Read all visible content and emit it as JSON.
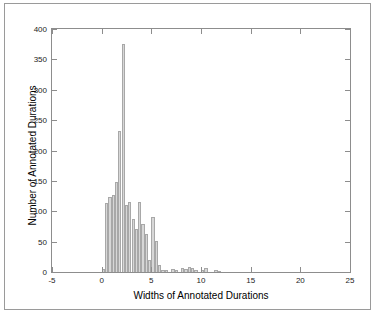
{
  "chart_data": {
    "type": "bar",
    "title": "",
    "subtitle": "",
    "xlabel": "Widths of Annotated Durations",
    "ylabel": "Number of Annotated Durations",
    "xlim": [
      -5,
      25
    ],
    "ylim": [
      0,
      400
    ],
    "xticks": [
      -5,
      0,
      5,
      10,
      15,
      20,
      25
    ],
    "xticklabels": [
      "-5",
      "0",
      "5",
      "10",
      "15",
      "20",
      "25"
    ],
    "yticks": [
      0,
      50,
      100,
      150,
      200,
      250,
      300,
      350,
      400
    ],
    "yticklabels": [
      "0",
      "50",
      "100",
      "150",
      "200",
      "250",
      "300",
      "350",
      "400"
    ],
    "grid": false,
    "legend": null,
    "bin_width": 0.333,
    "bar_fill_color": "#d7d7d7",
    "bar_edge_color": "#a8a8a8",
    "axis_color": "#8d8d8d",
    "frame_color": "#9a9a9a",
    "bins": [
      {
        "x": 0.17,
        "value": 5
      },
      {
        "x": 0.5,
        "value": 113
      },
      {
        "x": 0.83,
        "value": 124
      },
      {
        "x": 1.17,
        "value": 127
      },
      {
        "x": 1.5,
        "value": 148
      },
      {
        "x": 1.83,
        "value": 232
      },
      {
        "x": 2.17,
        "value": 375
      },
      {
        "x": 2.5,
        "value": 111
      },
      {
        "x": 2.83,
        "value": 116
      },
      {
        "x": 3.17,
        "value": 88
      },
      {
        "x": 3.5,
        "value": 71
      },
      {
        "x": 3.83,
        "value": 115
      },
      {
        "x": 4.17,
        "value": 79
      },
      {
        "x": 4.5,
        "value": 62
      },
      {
        "x": 4.83,
        "value": 19
      },
      {
        "x": 5.17,
        "value": 90
      },
      {
        "x": 5.5,
        "value": 51
      },
      {
        "x": 5.83,
        "value": 12
      },
      {
        "x": 6.17,
        "value": 4
      },
      {
        "x": 6.5,
        "value": 4
      },
      {
        "x": 7.17,
        "value": 5
      },
      {
        "x": 7.5,
        "value": 4
      },
      {
        "x": 8.17,
        "value": 7
      },
      {
        "x": 8.5,
        "value": 5
      },
      {
        "x": 8.83,
        "value": 8
      },
      {
        "x": 9.17,
        "value": 7
      },
      {
        "x": 9.5,
        "value": 4
      },
      {
        "x": 10.17,
        "value": 4
      },
      {
        "x": 10.5,
        "value": 6
      },
      {
        "x": 11.5,
        "value": 4
      },
      {
        "x": 11.83,
        "value": 2
      }
    ]
  }
}
